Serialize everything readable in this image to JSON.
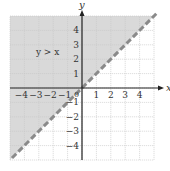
{
  "chart_data": {
    "type": "inequality-graph",
    "title": "",
    "xlabel": "x",
    "ylabel": "y",
    "xlim": [
      -5,
      5
    ],
    "ylim": [
      -5,
      5
    ],
    "grid": true,
    "x_ticks": [
      -4,
      -3,
      -2,
      -1,
      1,
      2,
      3,
      4
    ],
    "y_ticks": [
      -4,
      -3,
      -2,
      -1,
      1,
      2,
      3,
      4
    ],
    "x_tick_labels": [
      "−4",
      "−3",
      "−2",
      "−1",
      "1",
      "2",
      "3",
      "4"
    ],
    "y_tick_labels": [
      "−4",
      "−3",
      "−2",
      "−1",
      "1",
      "2",
      "3",
      "4"
    ],
    "origin_label": "0",
    "boundary_line": {
      "equation": "y = x",
      "style": "dashed",
      "points": [
        [
          -5,
          -5
        ],
        [
          5,
          5
        ]
      ]
    },
    "shaded_region": "y > x",
    "annotation": {
      "text": "y > x",
      "x": -3.2,
      "y": 2.3
    }
  },
  "colors": {
    "shade": "#d9d9d9",
    "grid": "#c8c8c8",
    "axis": "#222222",
    "boundary": "#8a8a8a",
    "background": "#ffffff"
  }
}
